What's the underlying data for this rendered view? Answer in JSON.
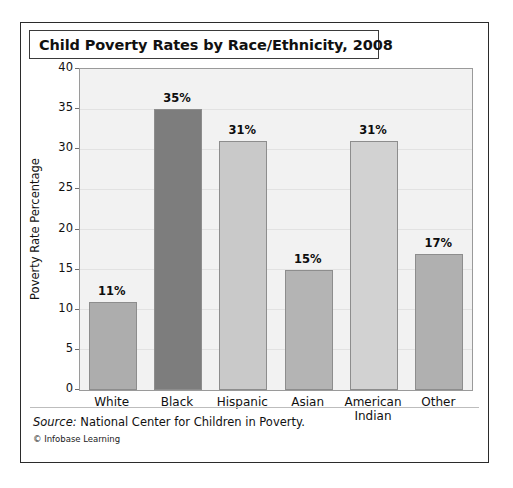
{
  "card": {
    "title": "Child Poverty Rates by Race/Ethnicity,  2008"
  },
  "footer": {
    "source_label": "Source:",
    "source_text": " National Center for Children in Poverty.",
    "credit_mark": "©",
    "credit_text": " Infobase Learning"
  },
  "chart_data": {
    "type": "bar",
    "title": "Child Poverty Rates by Race/Ethnicity,  2008",
    "xlabel": "",
    "ylabel": "Poverty Rate Percentage",
    "ylim": [
      0,
      40
    ],
    "ytick_step": 5,
    "yticks": [
      "0",
      "5",
      "10",
      "15",
      "20",
      "25",
      "30",
      "35",
      "40"
    ],
    "grid": true,
    "legend": "none",
    "categories": [
      "White",
      "Black",
      "Hispanic",
      "Asian",
      "American Indian",
      "Other"
    ],
    "category_lines": [
      [
        "White"
      ],
      [
        "Black"
      ],
      [
        "Hispanic"
      ],
      [
        "Asian"
      ],
      [
        "American",
        "Indian"
      ],
      [
        "Other"
      ]
    ],
    "values": [
      11,
      35,
      31,
      15,
      31,
      17
    ],
    "data_labels": [
      "11%",
      "35%",
      "31%",
      "15%",
      "31%",
      "17%"
    ],
    "bar_colors": [
      "#adadad",
      "#7d7d7d",
      "#c9c9c9",
      "#b4b4b4",
      "#d2d2d2",
      "#b0b0b0"
    ],
    "plot_background": "#f2f2f2",
    "grid_color": "#e2e2e2",
    "axis_color": "#9a9a9a",
    "text_color": "#111111"
  }
}
